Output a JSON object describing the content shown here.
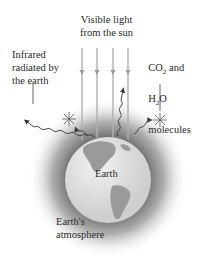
{
  "diagram": {
    "title_labels": {
      "visible_light": "Visible light\nfrom the sun",
      "infrared": "Infrared\nradiated by\nthe earth",
      "molecules_line1_pre": "CO",
      "molecules_line1_sub": "2",
      "molecules_line1_post": " and",
      "molecules_line2_pre": "H",
      "molecules_line2_sub": "2",
      "molecules_line2_post": "O",
      "molecules_line3": "molecules",
      "earth": "Earth",
      "atmosphere": "Earth's\natmosphere"
    },
    "colors": {
      "background": "#ffffff",
      "globe_light": "#e6e6e6",
      "land": "#9a9a9a",
      "atmosphere": "#6e6e6e",
      "lines": "#3a3a3a",
      "sun_rays": "#b0b0b0"
    },
    "icons": [
      "sun-ray-arrow",
      "infrared-wave-arrow",
      "molecule-star",
      "globe"
    ]
  }
}
